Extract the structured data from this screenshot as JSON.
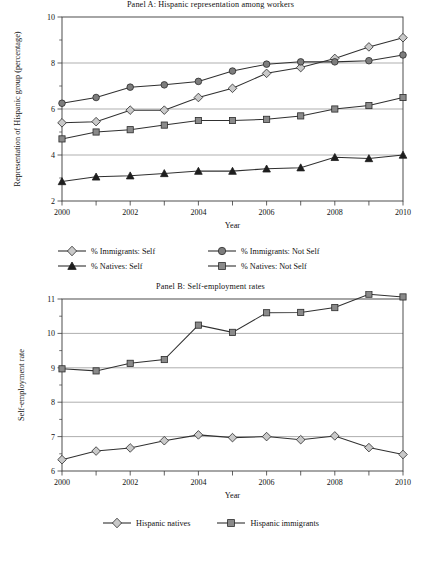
{
  "figure": {
    "background": "#ffffff",
    "line_color": "#303030",
    "grid_color": "#8d8d8d"
  },
  "panelA": {
    "title": "Panel A: Hispanic representation among workers",
    "xlabel": "Year",
    "ylabel": "Representation of Hispanic group (percentage)",
    "legend": [
      {
        "label": "% Immigrants: Self",
        "marker": "diamond-marker"
      },
      {
        "label": "% Immigrants: Not Self",
        "marker": "circle-marker"
      },
      {
        "label": "% Natives: Self",
        "marker": "triangle-marker"
      },
      {
        "label": "% Natives: Not Self",
        "marker": "square-marker"
      }
    ]
  },
  "panelB": {
    "title": "Panel B: Self-employment rates",
    "xlabel": "Year",
    "ylabel": "Self-employment rate",
    "legend": [
      {
        "label": "Hispanic natives",
        "marker": "diamond-marker"
      },
      {
        "label": "Hispanic immigrants",
        "marker": "square-marker"
      }
    ]
  },
  "chart_data": [
    {
      "type": "line",
      "title": "Panel A: Hispanic representation among workers",
      "xlabel": "Year",
      "ylabel": "Representation of Hispanic group (percentage)",
      "x": [
        2000,
        2001,
        2002,
        2003,
        2004,
        2005,
        2006,
        2007,
        2008,
        2009,
        2010
      ],
      "xtick_labels": [
        "2000",
        "",
        "2002",
        "",
        "2004",
        "",
        "2006",
        "",
        "2008",
        "",
        "2010"
      ],
      "xlim": [
        2000,
        2010
      ],
      "ylim": [
        2,
        10
      ],
      "yticks": [
        2,
        4,
        6,
        8,
        10
      ],
      "ytick_labels": [
        "2",
        "4",
        "6",
        "8",
        "10"
      ],
      "grid": true,
      "grid_axis": "y",
      "legend_position": "below-axes",
      "series": [
        {
          "name": "% Immigrants: Self",
          "marker": "diamond",
          "marker_fill": "#c9c9c9",
          "values": [
            5.4,
            5.45,
            5.95,
            5.95,
            6.5,
            6.9,
            7.55,
            7.8,
            8.2,
            8.7,
            9.1
          ]
        },
        {
          "name": "% Immigrants: Not Self",
          "marker": "circle",
          "marker_fill": "#7d7d7d",
          "values": [
            6.25,
            6.5,
            6.95,
            7.05,
            7.2,
            7.65,
            7.95,
            8.05,
            8.05,
            8.1,
            8.35
          ]
        },
        {
          "name": "% Natives: Self",
          "marker": "triangle",
          "marker_fill": "#1e1e1e",
          "values": [
            2.85,
            3.05,
            3.1,
            3.2,
            3.3,
            3.3,
            3.4,
            3.45,
            3.9,
            3.85,
            4.0
          ]
        },
        {
          "name": "% Natives: Not Self",
          "marker": "square",
          "marker_fill": "#8a8a8a",
          "values": [
            4.7,
            5.0,
            5.1,
            5.3,
            5.5,
            5.5,
            5.55,
            5.7,
            6.0,
            6.15,
            6.5
          ]
        }
      ]
    },
    {
      "type": "line",
      "title": "Panel B: Self-employment rates",
      "xlabel": "Year",
      "ylabel": "Self-employment rate",
      "x": [
        2000,
        2001,
        2002,
        2003,
        2004,
        2005,
        2006,
        2007,
        2008,
        2009,
        2010
      ],
      "xtick_labels": [
        "2000",
        "",
        "2002",
        "",
        "2004",
        "",
        "2006",
        "",
        "2008",
        "",
        "2010"
      ],
      "xlim": [
        2000,
        2010
      ],
      "ylim": [
        6,
        11
      ],
      "yticks": [
        6,
        7,
        8,
        9,
        10,
        11
      ],
      "ytick_labels": [
        "6",
        "7",
        "8",
        "9",
        "10",
        "11"
      ],
      "grid": true,
      "grid_axis": "y",
      "legend_position": "below-axes",
      "series": [
        {
          "name": "Hispanic natives",
          "marker": "diamond",
          "marker_fill": "#c9c9c9",
          "values": [
            6.33,
            6.58,
            6.67,
            6.88,
            7.05,
            6.97,
            7.0,
            6.91,
            7.02,
            6.68,
            6.48
          ]
        },
        {
          "name": "Hispanic immigrants",
          "marker": "square",
          "marker_fill": "#8a8a8a",
          "values": [
            8.97,
            8.91,
            9.13,
            9.24,
            10.24,
            10.03,
            10.6,
            10.61,
            10.75,
            11.14,
            11.06
          ]
        }
      ]
    }
  ]
}
